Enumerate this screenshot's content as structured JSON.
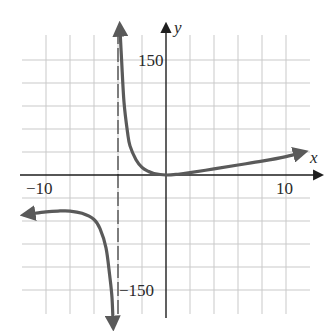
{
  "chart_data": {
    "type": "line",
    "title": "",
    "xlabel": "x",
    "ylabel": "y",
    "xlim": [
      -12,
      12.5
    ],
    "ylim": [
      -190,
      190
    ],
    "grid": true,
    "x_step": 2,
    "y_step": 30,
    "tick_labels": {
      "x": [
        {
          "value": -10,
          "label": "−10"
        },
        {
          "value": 10,
          "label": "10"
        }
      ],
      "y": [
        {
          "value": 150,
          "label": "150"
        },
        {
          "value": -150,
          "label": "−150"
        }
      ]
    },
    "asymptotes": [
      {
        "type": "vertical",
        "x": -4,
        "style": "dashed"
      }
    ],
    "series": [
      {
        "name": "right-branch",
        "points": [
          [
            -3.85,
            195
          ],
          [
            -3.7,
            150
          ],
          [
            -3.5,
            95
          ],
          [
            -3.2,
            55
          ],
          [
            -3.0,
            38
          ],
          [
            -2.5,
            20
          ],
          [
            -2.0,
            10
          ],
          [
            -1.5,
            5
          ],
          [
            -1.0,
            2
          ],
          [
            0,
            0
          ],
          [
            1,
            1
          ],
          [
            2,
            3
          ],
          [
            4,
            8
          ],
          [
            6,
            13
          ],
          [
            8,
            18
          ],
          [
            10,
            24
          ],
          [
            11.5,
            30
          ]
        ],
        "end_arrows": [
          "start",
          "end"
        ]
      },
      {
        "name": "left-branch",
        "points": [
          [
            -11.8,
            -52
          ],
          [
            -11,
            -50
          ],
          [
            -10,
            -48
          ],
          [
            -9,
            -47
          ],
          [
            -8,
            -47
          ],
          [
            -7,
            -50
          ],
          [
            -6,
            -58
          ],
          [
            -5.5,
            -70
          ],
          [
            -5,
            -95
          ],
          [
            -4.7,
            -130
          ],
          [
            -4.5,
            -160
          ],
          [
            -4.4,
            -198
          ]
        ],
        "end_arrows": [
          "start",
          "end"
        ]
      }
    ],
    "colors": {
      "curve": "#5a5a5a",
      "axes": "#1e1e1e",
      "grid": "#c9c9c9",
      "asymptote": "#3a3a3a"
    }
  }
}
